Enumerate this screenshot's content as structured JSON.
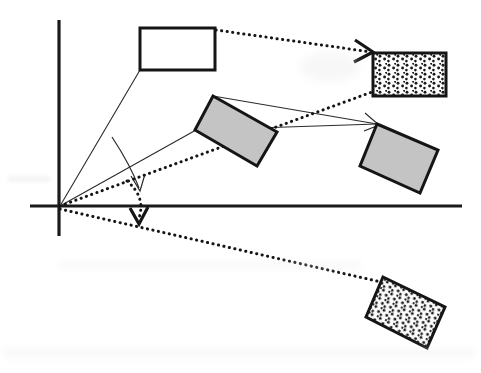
{
  "figure": {
    "kind": "geometric-vector-diagram",
    "background_color": "#ffffff",
    "width": 481,
    "height": 373
  },
  "palette": {
    "ink": "#151515",
    "thin_ink": "#2b2b2b",
    "gray_fill": "#c4c4c4",
    "white_fill": "#ffffff",
    "stipple_dot": "#1a1a1a",
    "scan_noise": "#e9e9e9"
  },
  "axes": {
    "origin": {
      "x": 60,
      "y": 206
    },
    "vertical": {
      "x": 59,
      "y1": 20,
      "y2": 236,
      "stroke_width": 3.2
    },
    "horizontal": {
      "y": 206,
      "x1": 30,
      "x2": 462,
      "stroke_width": 3.2
    }
  },
  "shapes": [
    {
      "name": "white-rectangle-upper-left",
      "fill": "white",
      "rotation_deg": 0,
      "points": [
        [
          140,
          28
        ],
        [
          215,
          28
        ],
        [
          215,
          70
        ],
        [
          140,
          70
        ]
      ]
    },
    {
      "name": "gray-rectangle-middle",
      "fill": "gray",
      "rotation_deg": 28,
      "points": [
        [
          213,
          96
        ],
        [
          277,
          132
        ],
        [
          257,
          166
        ],
        [
          195,
          130
        ]
      ]
    },
    {
      "name": "gray-rectangle-right",
      "fill": "gray",
      "rotation_deg": 21,
      "points": [
        [
          377,
          124
        ],
        [
          438,
          150
        ],
        [
          420,
          193
        ],
        [
          360,
          166
        ]
      ]
    },
    {
      "name": "stippled-rectangle-upper-right",
      "fill": "stipple",
      "rotation_deg": 0,
      "points": [
        [
          373,
          53
        ],
        [
          446,
          53
        ],
        [
          446,
          96
        ],
        [
          373,
          96
        ]
      ]
    },
    {
      "name": "stippled-rectangle-lower-right",
      "fill": "stipple",
      "rotation_deg": 25,
      "points": [
        [
          383,
          277
        ],
        [
          445,
          307
        ],
        [
          427,
          348
        ],
        [
          366,
          317
        ]
      ]
    }
  ],
  "connectors": [
    {
      "name": "thin-line-origin-to-white-rect",
      "style": "solid-thin",
      "from": [
        60,
        206
      ],
      "to": [
        140,
        70
      ],
      "arrowhead": false
    },
    {
      "name": "thin-line-origin-to-gray-middle-rect",
      "style": "solid-thin",
      "from": [
        60,
        206
      ],
      "to": [
        196,
        130
      ],
      "arrowhead": false
    },
    {
      "name": "thin-line-gray-middle-top-to-right-rect",
      "style": "solid-thin",
      "from": [
        213,
        96
      ],
      "to": [
        377,
        124
      ],
      "arrowhead": true
    },
    {
      "name": "thin-line-gray-middle-left-to-right-rect",
      "style": "solid-thin",
      "from": [
        196,
        130
      ],
      "to": [
        377,
        124
      ],
      "arrowhead": true
    },
    {
      "name": "dotted-line-white-rect-to-stippled-upper-right",
      "style": "dotted-heavy",
      "from": [
        216,
        30
      ],
      "to": [
        371,
        52
      ],
      "arrowhead": true
    },
    {
      "name": "dotted-line-origin-to-stippled-upper-right",
      "style": "dotted-heavy",
      "from": [
        60,
        206
      ],
      "to": [
        372,
        92
      ],
      "arrowhead": false
    },
    {
      "name": "dotted-line-origin-to-stippled-lower-right",
      "style": "dotted-heavy",
      "from": [
        60,
        209
      ],
      "to": [
        381,
        282
      ],
      "arrowhead": false
    }
  ],
  "angle_markers": [
    {
      "name": "solid-angle-arc-arrow",
      "style": "solid-thin",
      "arc_start": [
        112,
        138
      ],
      "arc_control": [
        128,
        172
      ],
      "arc_end": [
        140,
        190
      ],
      "arrow_tip": [
        140,
        190
      ],
      "arrow_direction": "down"
    },
    {
      "name": "dotted-angle-arc-arrow",
      "style": "dotted-heavy",
      "arc_start": [
        128,
        182
      ],
      "arc_control": [
        143,
        200
      ],
      "arc_end": [
        139,
        222
      ],
      "arrow_tip": [
        139,
        224
      ],
      "arrow_direction": "down"
    }
  ],
  "stipple": {
    "dot_radius": 1.45,
    "spacing": 8,
    "jitter": 2.2,
    "color": "#1a1a1a"
  }
}
